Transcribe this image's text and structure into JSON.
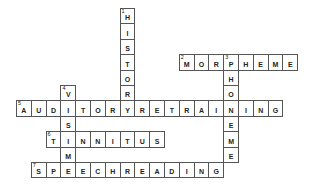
{
  "puzzle": {
    "grid": {
      "origin_x": 16,
      "origin_y": 8,
      "cell_w": 14.8,
      "cell_h": 15.4,
      "border_color": "#555555"
    },
    "words": [
      {
        "number": "1",
        "direction": "down",
        "answer": "HISTORY",
        "row": 0,
        "col": 7
      },
      {
        "number": "2",
        "direction": "across",
        "answer": "MORPHEME",
        "row": 3,
        "col": 11
      },
      {
        "number": "3",
        "direction": "down",
        "answer": "PHONEME",
        "row": 3,
        "col": 14
      },
      {
        "number": "4",
        "direction": "down",
        "answer": "VISIME",
        "row": 5,
        "col": 3
      },
      {
        "number": "5",
        "direction": "across",
        "answer": "AUDITORYRETRAINING",
        "row": 6,
        "col": 0
      },
      {
        "number": "6",
        "direction": "across",
        "answer": "TINNITUS",
        "row": 8,
        "col": 2
      },
      {
        "number": "7",
        "direction": "across",
        "answer": "SPEECHREADING",
        "row": 10,
        "col": 1
      }
    ]
  }
}
